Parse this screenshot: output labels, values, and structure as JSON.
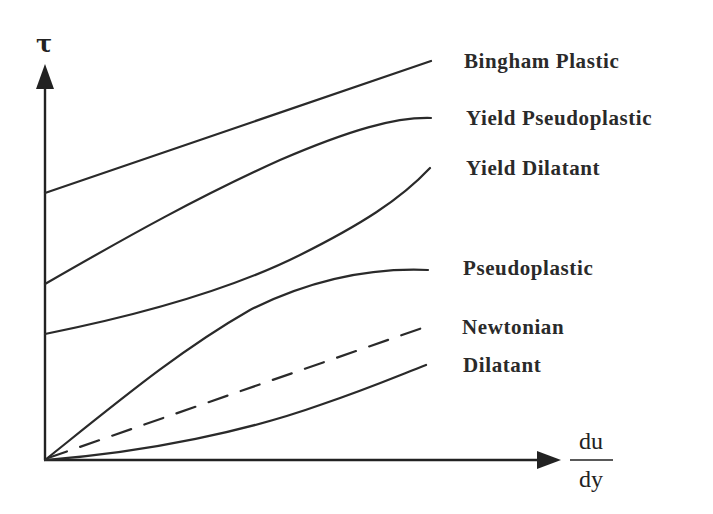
{
  "diagram": {
    "y_axis_label": "τ",
    "x_axis_label_numerator": "du",
    "x_axis_label_denominator": "dy",
    "curves": [
      {
        "name": "Bingham Plastic",
        "style": "solid",
        "intercept": "yes",
        "shape": "linear"
      },
      {
        "name": "Yield Pseudoplastic",
        "style": "solid",
        "intercept": "yes",
        "shape": "concave-down"
      },
      {
        "name": "Yield Dilatant",
        "style": "solid",
        "intercept": "yes",
        "shape": "concave-up"
      },
      {
        "name": "Pseudoplastic",
        "style": "solid",
        "intercept": "no",
        "shape": "concave-down"
      },
      {
        "name": "Newtonian",
        "style": "dashed",
        "intercept": "no",
        "shape": "linear"
      },
      {
        "name": "Dilatant",
        "style": "solid",
        "intercept": "no",
        "shape": "concave-up"
      }
    ],
    "line_color": "#2a2a2a",
    "background": "#ffffff"
  }
}
